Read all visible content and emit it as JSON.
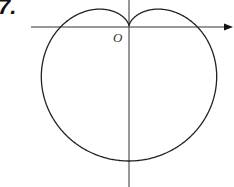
{
  "problem_number": "7.",
  "origin_label": "O",
  "curve": {
    "type": "cardioid",
    "equation": "r = a(1 - sin θ)",
    "stroke": "#222222"
  },
  "axes": {
    "x_arrow": true,
    "y_arrow": false,
    "color": "#333333"
  }
}
